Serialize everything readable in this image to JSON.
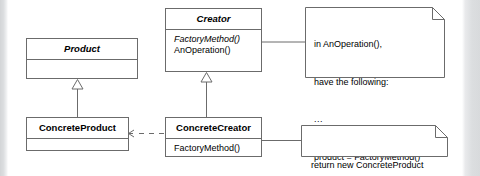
{
  "diagram": {
    "stroke_color": "#6b6b6b",
    "text_color": "#000000",
    "background_color": "#ffffff",
    "edge_band_color": "#d8dadc"
  },
  "classes": {
    "product": {
      "name": "Product",
      "abstract": true,
      "members": []
    },
    "creator": {
      "name": "Creator",
      "abstract": true,
      "members": [
        {
          "text": "FactoryMethod()",
          "italic": true
        },
        {
          "text": "AnOperation()",
          "italic": false
        }
      ]
    },
    "concrete_product": {
      "name": "ConcreteProduct",
      "abstract": false,
      "members": []
    },
    "concrete_creator": {
      "name": "ConcreteCreator",
      "abstract": false,
      "members": [
        {
          "text": "FactoryMethod()",
          "italic": false
        }
      ]
    }
  },
  "notes": {
    "an_operation": {
      "lines": [
        "in AnOperation(),",
        "have the following:",
        "...",
        "product = FactoryMethod()",
        "..."
      ],
      "attached_to": "Creator"
    },
    "return_new": {
      "lines": [
        "return new ConcreteProduct"
      ],
      "attached_to": "ConcreteCreator"
    }
  },
  "relations": [
    {
      "name": "product-generalization",
      "type": "generalization",
      "from": "ConcreteProduct",
      "to": "Product",
      "style": "solid",
      "arrowhead": "hollow-triangle"
    },
    {
      "name": "creator-generalization",
      "type": "generalization",
      "from": "ConcreteCreator",
      "to": "Creator",
      "style": "solid",
      "arrowhead": "hollow-triangle"
    },
    {
      "name": "creates-dependency",
      "type": "dependency",
      "from": "ConcreteCreator",
      "to": "ConcreteProduct",
      "style": "dashed",
      "arrowhead": "open-arrow"
    },
    {
      "name": "creator-note-link",
      "type": "note-anchor",
      "from": "Creator",
      "to": "in AnOperation() note",
      "style": "solid",
      "arrowhead": "none"
    },
    {
      "name": "concretecreator-note-link",
      "type": "note-anchor",
      "from": "ConcreteCreator",
      "to": "return new ConcreteProduct note",
      "style": "solid",
      "arrowhead": "none"
    }
  ]
}
